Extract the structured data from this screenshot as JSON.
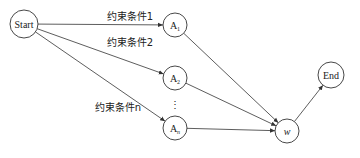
{
  "diagram": {
    "nodes": [
      {
        "id": "start",
        "label": "Start"
      },
      {
        "id": "a1",
        "label": "A",
        "sub": "1"
      },
      {
        "id": "a2",
        "label": "A",
        "sub": "2"
      },
      {
        "id": "an",
        "label": "A",
        "sub": "n"
      },
      {
        "id": "w",
        "label": "w"
      },
      {
        "id": "end",
        "label": "End"
      }
    ],
    "edges": [
      {
        "from": "start",
        "to": "a1",
        "label": "约束条件1"
      },
      {
        "from": "start",
        "to": "a2",
        "label": "约束条件2"
      },
      {
        "from": "start",
        "to": "an",
        "label": "约束条件n"
      },
      {
        "from": "a1",
        "to": "w"
      },
      {
        "from": "a2",
        "to": "w"
      },
      {
        "from": "an",
        "to": "w"
      },
      {
        "from": "w",
        "to": "end"
      }
    ],
    "ellipsis": "⋮"
  }
}
